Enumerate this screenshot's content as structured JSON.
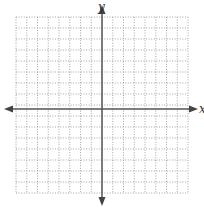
{
  "diagram": {
    "type": "coordinate-plane",
    "axes": {
      "x_label": "x",
      "y_label": "y",
      "arrows": "both-ends"
    },
    "grid": {
      "columns": 16,
      "rows": 16,
      "style": "dotted",
      "x_range": [
        -8,
        8
      ],
      "y_range": [
        -8,
        8
      ]
    },
    "colors": {
      "axis": "#555555",
      "grid": "#9a9a9a",
      "background": "#ffffff"
    }
  }
}
